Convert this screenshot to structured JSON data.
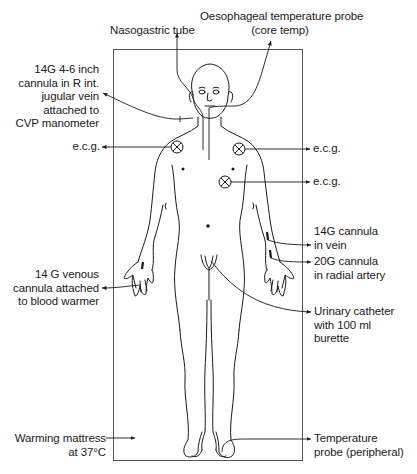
{
  "diagram": {
    "type": "medical-setup-illustration",
    "labels": {
      "nasogastric": "Nasogastric tube",
      "oesophageal_line1": "Oesophageal temperature probe",
      "oesophageal_line2": "(core temp)",
      "cvp_line1": "14G 4-6 inch",
      "cvp_line2": "cannula in  R int.",
      "cvp_line3": "jugular vein",
      "cvp_line4": "attached  to",
      "cvp_line5": "CVP manometer",
      "ecg_left": "e.c.g.",
      "ecg_right_upper": "e.c.g.",
      "ecg_right_lower": "e.c.g.",
      "cannula_vein_line1": "14G cannula",
      "cannula_vein_line2": "in vein",
      "radial_line1": "20G  cannula",
      "radial_line2": "in radial artery",
      "venous_line1": "14 G  venous",
      "venous_line2": "cannula attached",
      "venous_line3": "to blood warmer",
      "urinary_line1": "Urinary catheter",
      "urinary_line2": "with 100 ml",
      "urinary_line3": "burette",
      "mattress_line1": "Warming mattress",
      "mattress_line2": "at 37°C",
      "temp_line1": "Temperature",
      "temp_line2": "probe (peripheral)"
    },
    "electrodes": [
      "ecg-left-shoulder",
      "ecg-right-shoulder",
      "ecg-right-chest"
    ],
    "colors": {
      "line": "#1a1a1a",
      "frame": "#555555",
      "background": "#ffffff"
    }
  }
}
